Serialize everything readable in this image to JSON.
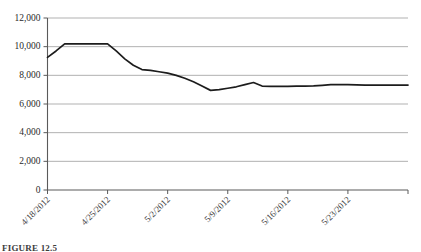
{
  "figure": {
    "caption": "FIGURE 12.5"
  },
  "chart_data": {
    "type": "line",
    "title": "",
    "xlabel": "",
    "ylabel": "",
    "ylim": [
      0,
      12000
    ],
    "ytick_step": 2000,
    "ytick_labels": [
      "0",
      "2,000",
      "4,000",
      "6,000",
      "8,000",
      "10,000",
      "12,000"
    ],
    "ytick_values": [
      0,
      2000,
      4000,
      6000,
      8000,
      10000,
      12000
    ],
    "xtick_labels": [
      "4/18/2012",
      "4/25/2012",
      "5/2/2012",
      "5/9/2012",
      "5/16/2012",
      "5/23/2012"
    ],
    "xtick_indices": [
      0,
      7,
      14,
      21,
      28,
      35
    ],
    "xtick_rotation": 45,
    "grid": true,
    "legend": false,
    "legend_position": "none",
    "line_color": "#1c1c1c",
    "grid_color": "#a8a8a8",
    "axis_color": "#5a5a5a",
    "x": [
      0,
      1,
      2,
      3,
      4,
      5,
      6,
      7,
      8,
      9,
      10,
      11,
      12,
      13,
      14,
      15,
      16,
      17,
      18,
      19,
      20,
      21,
      22,
      23,
      24,
      25,
      26,
      27,
      28,
      29,
      30,
      31,
      32,
      33,
      34,
      35,
      36,
      37,
      38,
      39,
      40,
      41,
      42
    ],
    "values": [
      9250,
      9700,
      10200,
      10200,
      10200,
      10200,
      10200,
      10200,
      9700,
      9150,
      8700,
      8400,
      8350,
      8250,
      8150,
      8000,
      7800,
      7550,
      7250,
      6950,
      7000,
      7100,
      7200,
      7350,
      7500,
      7250,
      7230,
      7230,
      7230,
      7250,
      7250,
      7260,
      7300,
      7350,
      7360,
      7350,
      7330,
      7320,
      7320,
      7320,
      7320,
      7320,
      7320
    ],
    "series": [
      {
        "name": "Value",
        "values": [
          9250,
          9700,
          10200,
          10200,
          10200,
          10200,
          10200,
          10200,
          9700,
          9150,
          8700,
          8400,
          8350,
          8250,
          8150,
          8000,
          7800,
          7550,
          7250,
          6950,
          7000,
          7100,
          7200,
          7350,
          7500,
          7250,
          7230,
          7230,
          7230,
          7250,
          7250,
          7260,
          7300,
          7350,
          7360,
          7350,
          7330,
          7320,
          7320,
          7320,
          7320,
          7320,
          7320
        ]
      }
    ],
    "annotations": []
  }
}
